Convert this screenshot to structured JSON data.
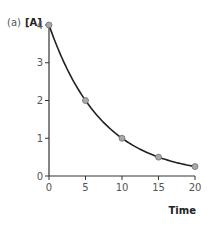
{
  "panel_label": "(a)",
  "chart_data": {
    "type": "line",
    "title": "",
    "xlabel": "Time",
    "ylabel": "[A]",
    "x": [
      0,
      5,
      10,
      15,
      20
    ],
    "series": [
      {
        "name": "[A]",
        "values": [
          4,
          2,
          1,
          0.5,
          0.25
        ]
      }
    ],
    "xticks": [
      0,
      5,
      10,
      15,
      20
    ],
    "yticks": [
      0,
      1,
      2,
      3,
      4
    ],
    "xlim": [
      0,
      20
    ],
    "ylim": [
      0,
      4
    ],
    "grid": false,
    "curve": "exponential decay (smooth)",
    "marker_color": "#9a9a9a",
    "line_color": "#222222"
  },
  "colors": {
    "axis": "#333333",
    "tick_label": "#555555",
    "marker_fill": "#a8a8a8",
    "marker_stroke": "#707070"
  }
}
